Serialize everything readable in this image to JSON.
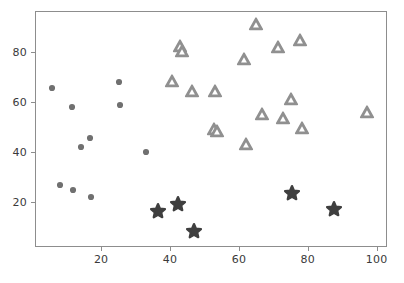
{
  "chart_data": {
    "type": "scatter",
    "title": "",
    "xlabel": "",
    "ylabel": "",
    "xlim": [
      0.8,
      103.0
    ],
    "ylim": [
      2.0,
      96.5
    ],
    "grid": false,
    "legend": null,
    "xticks": [
      20,
      40,
      60,
      80,
      100
    ],
    "yticks": [
      20,
      40,
      60,
      80
    ],
    "xticklabels": [
      "20",
      "40",
      "60",
      "80",
      "100"
    ],
    "yticklabels": [
      "20",
      "40",
      "60",
      "80"
    ],
    "series": [
      {
        "name": "circles",
        "marker": "circle",
        "color": "#707070",
        "edgecolor": "#707070",
        "size": 7,
        "points": [
          {
            "x": 5.5,
            "y": 66.0
          },
          {
            "x": 11.3,
            "y": 58.3
          },
          {
            "x": 14.0,
            "y": 42.3
          },
          {
            "x": 16.6,
            "y": 46.2
          },
          {
            "x": 7.9,
            "y": 27.2
          },
          {
            "x": 11.6,
            "y": 25.3
          },
          {
            "x": 16.7,
            "y": 22.3
          },
          {
            "x": 25.0,
            "y": 68.4
          },
          {
            "x": 25.1,
            "y": 59.2
          },
          {
            "x": 32.8,
            "y": 40.3
          }
        ]
      },
      {
        "name": "triangles",
        "marker": "triangle-up",
        "color": "#909090",
        "edgecolor": "#909090",
        "size": 15,
        "points": [
          {
            "x": 40.2,
            "y": 69.0
          },
          {
            "x": 42.5,
            "y": 82.8
          },
          {
            "x": 43.2,
            "y": 81.0
          },
          {
            "x": 46.0,
            "y": 64.8
          },
          {
            "x": 52.8,
            "y": 65.0
          },
          {
            "x": 52.5,
            "y": 49.7
          },
          {
            "x": 53.3,
            "y": 48.8
          },
          {
            "x": 61.3,
            "y": 77.8
          },
          {
            "x": 61.7,
            "y": 43.6
          },
          {
            "x": 64.8,
            "y": 91.5
          },
          {
            "x": 66.5,
            "y": 55.6
          },
          {
            "x": 71.2,
            "y": 82.3
          },
          {
            "x": 72.4,
            "y": 54.2
          },
          {
            "x": 74.7,
            "y": 61.5
          },
          {
            "x": 77.5,
            "y": 85.3
          },
          {
            "x": 78.1,
            "y": 50.2
          },
          {
            "x": 96.8,
            "y": 56.3
          }
        ]
      },
      {
        "name": "stars",
        "marker": "star",
        "color": "#3f3f3f",
        "edgecolor": "#3f3f3f",
        "size": 17,
        "points": [
          {
            "x": 36.3,
            "y": 16.7
          },
          {
            "x": 42.1,
            "y": 19.8
          },
          {
            "x": 46.8,
            "y": 8.9
          },
          {
            "x": 75.1,
            "y": 23.9
          },
          {
            "x": 87.3,
            "y": 17.5
          }
        ]
      }
    ]
  },
  "axis": {
    "frame_color": "#8d8d8d",
    "tick_label_color": "#3a3a3a",
    "background": "#ffffff"
  }
}
